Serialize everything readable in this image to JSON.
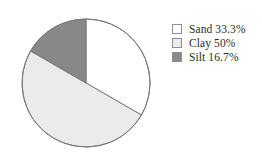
{
  "chart_data": {
    "type": "pie",
    "title": "",
    "subtitle": "",
    "xlabel": "",
    "ylabel": "",
    "grid": false,
    "legend_position": "right",
    "start_angle_deg": 90,
    "direction": "clockwise",
    "categories": [
      "Sand",
      "Clay",
      "Silt"
    ],
    "values": [
      33.3,
      50,
      16.7
    ],
    "value_unit": "%",
    "slices": [
      {
        "label": "Sand",
        "value": 33.3,
        "value_text": "33.3%",
        "legend_text": "Sand 33.3%",
        "color": "#ffffff",
        "angle_deg": 120,
        "start_deg": 0,
        "end_deg": 120
      },
      {
        "label": "Clay",
        "value": 50,
        "value_text": "50%",
        "legend_text": "Clay 50%",
        "color": "#ebebeb",
        "angle_deg": 180,
        "start_deg": 120,
        "end_deg": 300
      },
      {
        "label": "Silt",
        "value": 16.7,
        "value_text": "16.7%",
        "legend_text": "Silt 16.7%",
        "color": "#888888",
        "angle_deg": 60,
        "start_deg": 300,
        "end_deg": 360
      }
    ]
  },
  "pie": {
    "center_x": 66,
    "center_y": 68,
    "radius": 64,
    "outline_color": "#7a7a7a",
    "outline_width": 1
  },
  "legend": {
    "rows": [
      {
        "label": "Sand 33.3%",
        "color": "#ffffff"
      },
      {
        "label": "Clay 50%",
        "color": "#ebebeb"
      },
      {
        "label": "Silt 16.7%",
        "color": "#888888"
      }
    ]
  },
  "colors": {
    "background": "#ffffff",
    "sand": "#ffffff",
    "clay": "#ebebeb",
    "silt": "#888888",
    "outline": "#7a7a7a",
    "text": "#2b2b2b",
    "swatch_border": "#8e8e8e"
  }
}
